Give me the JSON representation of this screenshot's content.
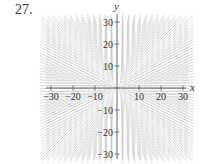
{
  "problem": {
    "number": "27."
  },
  "axes": {
    "x_label": "x",
    "y_label": "y",
    "x_ticks": [
      "−30",
      "−20",
      "−10",
      "10",
      "20",
      "30"
    ],
    "y_ticks": [
      "30",
      "20",
      "10",
      "−10",
      "−20",
      "−30"
    ],
    "range": [
      -30,
      30
    ]
  },
  "colors": {
    "segment": "#bdbdbd",
    "axis": "#555555",
    "text": "#333333"
  },
  "slope_field": {
    "description": "Direction field; segments radiate from origin (slope ≈ y/x). Negative slopes in quadrants II and IV, positive in I and III; steep near y-axis, flat near x-axis.",
    "grid_step": 2.5
  }
}
